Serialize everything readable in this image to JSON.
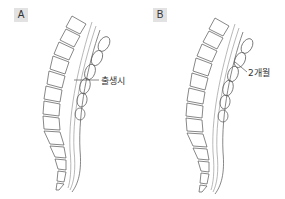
{
  "panels": [
    {
      "id": "A",
      "tag": "A",
      "caption": "출생시",
      "subject": "spine-lateral-view-at-birth"
    },
    {
      "id": "B",
      "tag": "B",
      "caption": "2개월",
      "subject": "spine-lateral-view-2-months"
    }
  ],
  "colors": {
    "line": "#555555",
    "tag_bg": "#e2e2e2",
    "canal": "#bbbbbb"
  }
}
